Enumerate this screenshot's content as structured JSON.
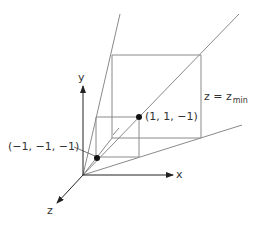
{
  "diagram": {
    "type": "3d-view-frustum",
    "axes": {
      "x_label": "x",
      "y_label": "y",
      "z_label": "z"
    },
    "points": [
      {
        "label": "(−1, −1, −1)",
        "coord": [
          -1,
          -1,
          -1
        ]
      },
      {
        "label": "(1, 1, −1)",
        "coord": [
          1,
          1,
          -1
        ]
      }
    ],
    "plane_label": {
      "main": "z = z",
      "subscript": "min"
    },
    "colors": {
      "axis": "#222222",
      "frustum": "#8a8a8a",
      "point": "#111111",
      "text": "#333333"
    }
  }
}
